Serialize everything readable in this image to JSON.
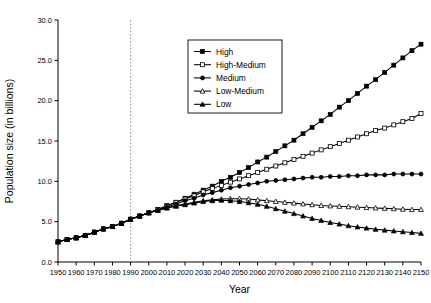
{
  "chart_data": {
    "type": "line",
    "title": "",
    "xlabel": "Year",
    "ylabel": "Population size (in billions)",
    "xlim": [
      1950,
      2150
    ],
    "ylim": [
      0.0,
      30.0
    ],
    "xticks": [
      1950,
      1960,
      1970,
      1980,
      1990,
      2000,
      2010,
      2020,
      2030,
      2040,
      2050,
      2060,
      2070,
      2080,
      2090,
      2100,
      2110,
      2120,
      2130,
      2140,
      2150
    ],
    "xticklabels": [
      "1950",
      "1960",
      "1970",
      "1980",
      "1990",
      "2000",
      "2010",
      "2020",
      "2030",
      "2040",
      "2050",
      "2060",
      "2070",
      "2080",
      "2090",
      "2100",
      "2110",
      "2120",
      "2130",
      "2140",
      "2150"
    ],
    "yticks": [
      0.0,
      5.0,
      10.0,
      15.0,
      20.0,
      25.0,
      30.0
    ],
    "yticklabels": [
      "0.0",
      "5.0",
      "10.0",
      "15.0",
      "20.0",
      "25.0",
      "30.0"
    ],
    "grid": false,
    "legend_position": "upper-center-left",
    "annotations": [
      {
        "name": "present-day-divider",
        "type": "vline",
        "x": 1990,
        "style": "dashed",
        "color": "#999999"
      }
    ],
    "x": [
      1950,
      1955,
      1960,
      1965,
      1970,
      1975,
      1980,
      1985,
      1990,
      1995,
      2000,
      2005,
      2010,
      2015,
      2020,
      2025,
      2030,
      2035,
      2040,
      2045,
      2050,
      2055,
      2060,
      2065,
      2070,
      2075,
      2080,
      2085,
      2090,
      2095,
      2100,
      2105,
      2110,
      2115,
      2120,
      2125,
      2130,
      2135,
      2140,
      2145,
      2150
    ],
    "series": [
      {
        "name": "High",
        "marker": "filled-square",
        "color": "#000000",
        "values": [
          2.5,
          2.8,
          3.0,
          3.3,
          3.7,
          4.1,
          4.4,
          4.8,
          5.3,
          5.7,
          6.1,
          6.5,
          7.0,
          7.4,
          7.9,
          8.4,
          8.9,
          9.4,
          10.0,
          10.5,
          11.1,
          11.7,
          12.4,
          13.0,
          13.7,
          14.4,
          15.1,
          15.9,
          16.7,
          17.5,
          18.3,
          19.2,
          20.0,
          20.9,
          21.8,
          22.6,
          23.5,
          24.4,
          25.3,
          26.2,
          27.0
        ]
      },
      {
        "name": "High-Medium",
        "marker": "open-square",
        "color": "#000000",
        "values": [
          2.5,
          2.8,
          3.0,
          3.3,
          3.7,
          4.1,
          4.4,
          4.8,
          5.3,
          5.7,
          6.1,
          6.5,
          6.9,
          7.4,
          7.8,
          8.2,
          8.7,
          9.1,
          9.5,
          9.9,
          10.3,
          10.7,
          11.1,
          11.5,
          11.9,
          12.3,
          12.7,
          13.1,
          13.5,
          13.9,
          14.3,
          14.7,
          15.1,
          15.5,
          15.9,
          16.3,
          16.6,
          17.0,
          17.4,
          17.8,
          18.4
        ]
      },
      {
        "name": "Medium",
        "marker": "filled-circle",
        "color": "#000000",
        "values": [
          2.5,
          2.8,
          3.0,
          3.3,
          3.7,
          4.1,
          4.4,
          4.8,
          5.3,
          5.7,
          6.1,
          6.4,
          6.8,
          7.2,
          7.6,
          7.9,
          8.3,
          8.6,
          8.9,
          9.2,
          9.4,
          9.6,
          9.8,
          10.0,
          10.1,
          10.2,
          10.3,
          10.4,
          10.5,
          10.5,
          10.6,
          10.6,
          10.7,
          10.7,
          10.8,
          10.8,
          10.8,
          10.9,
          10.9,
          10.9,
          10.9
        ]
      },
      {
        "name": "Low-Medium",
        "marker": "open-triangle",
        "color": "#000000",
        "values": [
          2.5,
          2.8,
          3.0,
          3.3,
          3.7,
          4.1,
          4.4,
          4.8,
          5.3,
          5.7,
          6.1,
          6.4,
          6.7,
          7.0,
          7.2,
          7.4,
          7.6,
          7.7,
          7.8,
          7.85,
          7.85,
          7.8,
          7.7,
          7.6,
          7.5,
          7.4,
          7.3,
          7.2,
          7.1,
          7.0,
          6.95,
          6.9,
          6.85,
          6.8,
          6.75,
          6.7,
          6.65,
          6.6,
          6.55,
          6.5,
          6.5
        ]
      },
      {
        "name": "Low",
        "marker": "filled-triangle",
        "color": "#000000",
        "values": [
          2.5,
          2.8,
          3.0,
          3.3,
          3.7,
          4.1,
          4.4,
          4.8,
          5.3,
          5.7,
          6.1,
          6.4,
          6.7,
          6.9,
          7.1,
          7.3,
          7.5,
          7.6,
          7.65,
          7.6,
          7.5,
          7.35,
          7.15,
          6.9,
          6.6,
          6.3,
          6.0,
          5.7,
          5.4,
          5.15,
          4.9,
          4.7,
          4.5,
          4.35,
          4.2,
          4.05,
          3.95,
          3.85,
          3.75,
          3.65,
          3.55
        ]
      }
    ]
  }
}
